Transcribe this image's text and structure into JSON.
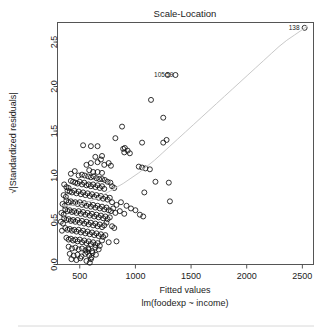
{
  "plot": {
    "title": "Scale-Location",
    "xlabel": "Fitted values",
    "sublabel": "lm(foodexp ~ income)",
    "ylabel": "√|Standardized residuals|",
    "ylabel_radical": "√",
    "ylabel_body": "|Standardized residuals|"
  },
  "axes": {
    "x_ticks": [
      "500",
      "1000",
      "1500",
      "2000",
      "2500"
    ],
    "y_ticks": [
      "0.0",
      "0.5",
      "1.0",
      "1.5",
      "2.0",
      "2.5"
    ]
  },
  "annotations": [
    {
      "name": "outlier-label-138",
      "text": "138",
      "x": 2520,
      "y": 2.66
    },
    {
      "name": "outlier-label-105",
      "text": "105",
      "x": 1310,
      "y": 2.13
    },
    {
      "name": "outlier-label-59",
      "text": "59",
      "x": 1385,
      "y": 2.13
    }
  ],
  "colors": {
    "point_stroke": "#111111",
    "loess_line": "#c9c9c9",
    "axis": "#555555",
    "text": "#222222",
    "background": "#ffffff"
  },
  "chart_data": {
    "type": "scatter",
    "title": "Scale-Location",
    "xlabel": "Fitted values",
    "ylabel": "√|Standardized residuals|",
    "sublabel": "lm(foodexp ~ income)",
    "grid": false,
    "legend": "none",
    "xlim": [
      300,
      2600
    ],
    "ylim": [
      0.0,
      2.72
    ],
    "x_ticks": [
      500,
      1000,
      1500,
      2000,
      2500
    ],
    "y_ticks": [
      0.0,
      0.5,
      1.0,
      1.5,
      2.0,
      2.5
    ],
    "point_marker": "open-circle",
    "points": [
      [
        2520,
        2.66
      ],
      [
        1290,
        2.13
      ],
      [
        1360,
        2.13
      ],
      [
        1140,
        1.85
      ],
      [
        1250,
        1.65
      ],
      [
        880,
        1.55
      ],
      [
        1280,
        1.4
      ],
      [
        1250,
        1.37
      ],
      [
        1060,
        1.37
      ],
      [
        820,
        1.42
      ],
      [
        530,
        1.34
      ],
      [
        600,
        1.33
      ],
      [
        660,
        1.33
      ],
      [
        905,
        1.31
      ],
      [
        930,
        1.28
      ],
      [
        900,
        1.26
      ],
      [
        950,
        1.25
      ],
      [
        890,
        1.3
      ],
      [
        700,
        1.22
      ],
      [
        690,
        1.18
      ],
      [
        640,
        1.21
      ],
      [
        660,
        1.15
      ],
      [
        600,
        1.14
      ],
      [
        560,
        1.12
      ],
      [
        720,
        1.12
      ],
      [
        760,
        1.14
      ],
      [
        780,
        1.11
      ],
      [
        1030,
        1.1
      ],
      [
        1060,
        1.09
      ],
      [
        1090,
        1.08
      ],
      [
        1130,
        1.07
      ],
      [
        585,
        1.06
      ],
      [
        620,
        1.04
      ],
      [
        660,
        1.04
      ],
      [
        700,
        1.03
      ],
      [
        455,
        1.05
      ],
      [
        420,
        1.02
      ],
      [
        490,
        1.0
      ],
      [
        520,
        1.01
      ],
      [
        545,
        1.0
      ],
      [
        575,
        0.99
      ],
      [
        600,
        0.98
      ],
      [
        625,
        0.99
      ],
      [
        650,
        0.97
      ],
      [
        675,
        0.96
      ],
      [
        700,
        0.96
      ],
      [
        725,
        0.95
      ],
      [
        750,
        0.93
      ],
      [
        775,
        0.92
      ],
      [
        420,
        0.94
      ],
      [
        440,
        0.93
      ],
      [
        460,
        0.92
      ],
      [
        480,
        0.91
      ],
      [
        500,
        0.93
      ],
      [
        520,
        0.9
      ],
      [
        540,
        0.92
      ],
      [
        560,
        0.89
      ],
      [
        580,
        0.9
      ],
      [
        600,
        0.88
      ],
      [
        620,
        0.9
      ],
      [
        640,
        0.87
      ],
      [
        660,
        0.89
      ],
      [
        680,
        0.86
      ],
      [
        700,
        0.88
      ],
      [
        720,
        0.85
      ],
      [
        360,
        0.9
      ],
      [
        380,
        0.87
      ],
      [
        400,
        0.86
      ],
      [
        790,
        0.88
      ],
      [
        810,
        0.86
      ],
      [
        1180,
        0.93
      ],
      [
        1300,
        0.92
      ],
      [
        1080,
        0.81
      ],
      [
        1310,
        0.71
      ],
      [
        390,
        0.83
      ],
      [
        410,
        0.82
      ],
      [
        430,
        0.81
      ],
      [
        450,
        0.83
      ],
      [
        470,
        0.8
      ],
      [
        490,
        0.82
      ],
      [
        510,
        0.79
      ],
      [
        530,
        0.81
      ],
      [
        550,
        0.78
      ],
      [
        570,
        0.8
      ],
      [
        590,
        0.77
      ],
      [
        610,
        0.79
      ],
      [
        630,
        0.76
      ],
      [
        650,
        0.78
      ],
      [
        670,
        0.75
      ],
      [
        690,
        0.77
      ],
      [
        710,
        0.74
      ],
      [
        730,
        0.76
      ],
      [
        750,
        0.73
      ],
      [
        770,
        0.75
      ],
      [
        355,
        0.78
      ],
      [
        375,
        0.76
      ],
      [
        790,
        0.7
      ],
      [
        830,
        0.67
      ],
      [
        870,
        0.7
      ],
      [
        920,
        0.66
      ],
      [
        960,
        0.63
      ],
      [
        1000,
        0.61
      ],
      [
        1040,
        0.56
      ],
      [
        1070,
        0.54
      ],
      [
        380,
        0.72
      ],
      [
        400,
        0.7
      ],
      [
        420,
        0.71
      ],
      [
        440,
        0.69
      ],
      [
        460,
        0.7
      ],
      [
        480,
        0.68
      ],
      [
        500,
        0.7
      ],
      [
        520,
        0.67
      ],
      [
        540,
        0.69
      ],
      [
        560,
        0.66
      ],
      [
        580,
        0.68
      ],
      [
        600,
        0.65
      ],
      [
        620,
        0.67
      ],
      [
        640,
        0.64
      ],
      [
        660,
        0.66
      ],
      [
        680,
        0.63
      ],
      [
        700,
        0.65
      ],
      [
        720,
        0.62
      ],
      [
        740,
        0.64
      ],
      [
        760,
        0.61
      ],
      [
        345,
        0.68
      ],
      [
        365,
        0.66
      ],
      [
        780,
        0.6
      ],
      [
        800,
        0.63
      ],
      [
        820,
        0.58
      ],
      [
        860,
        0.6
      ],
      [
        900,
        0.57
      ],
      [
        370,
        0.62
      ],
      [
        390,
        0.6
      ],
      [
        410,
        0.61
      ],
      [
        430,
        0.59
      ],
      [
        450,
        0.6
      ],
      [
        470,
        0.58
      ],
      [
        490,
        0.6
      ],
      [
        510,
        0.57
      ],
      [
        530,
        0.59
      ],
      [
        550,
        0.56
      ],
      [
        570,
        0.58
      ],
      [
        590,
        0.55
      ],
      [
        610,
        0.57
      ],
      [
        630,
        0.54
      ],
      [
        650,
        0.56
      ],
      [
        670,
        0.53
      ],
      [
        690,
        0.55
      ],
      [
        710,
        0.52
      ],
      [
        335,
        0.58
      ],
      [
        355,
        0.56
      ],
      [
        730,
        0.54
      ],
      [
        750,
        0.51
      ],
      [
        770,
        0.53
      ],
      [
        360,
        0.52
      ],
      [
        380,
        0.5
      ],
      [
        400,
        0.51
      ],
      [
        420,
        0.49
      ],
      [
        440,
        0.5
      ],
      [
        460,
        0.48
      ],
      [
        480,
        0.5
      ],
      [
        500,
        0.47
      ],
      [
        520,
        0.49
      ],
      [
        540,
        0.46
      ],
      [
        560,
        0.48
      ],
      [
        580,
        0.45
      ],
      [
        600,
        0.47
      ],
      [
        620,
        0.44
      ],
      [
        640,
        0.46
      ],
      [
        660,
        0.43
      ],
      [
        680,
        0.45
      ],
      [
        700,
        0.42
      ],
      [
        720,
        0.44
      ],
      [
        740,
        0.47
      ],
      [
        330,
        0.48
      ],
      [
        350,
        0.46
      ],
      [
        790,
        0.43
      ],
      [
        810,
        0.41
      ],
      [
        370,
        0.41
      ],
      [
        390,
        0.39
      ],
      [
        410,
        0.4
      ],
      [
        430,
        0.38
      ],
      [
        450,
        0.39
      ],
      [
        470,
        0.37
      ],
      [
        490,
        0.39
      ],
      [
        510,
        0.36
      ],
      [
        530,
        0.38
      ],
      [
        550,
        0.35
      ],
      [
        570,
        0.37
      ],
      [
        590,
        0.34
      ],
      [
        610,
        0.36
      ],
      [
        630,
        0.33
      ],
      [
        650,
        0.35
      ],
      [
        670,
        0.32
      ],
      [
        690,
        0.34
      ],
      [
        710,
        0.31
      ],
      [
        730,
        0.33
      ],
      [
        340,
        0.38
      ],
      [
        380,
        0.3
      ],
      [
        400,
        0.28
      ],
      [
        420,
        0.29
      ],
      [
        440,
        0.27
      ],
      [
        460,
        0.28
      ],
      [
        480,
        0.26
      ],
      [
        500,
        0.28
      ],
      [
        520,
        0.25
      ],
      [
        540,
        0.27
      ],
      [
        560,
        0.24
      ],
      [
        580,
        0.26
      ],
      [
        600,
        0.23
      ],
      [
        620,
        0.25
      ],
      [
        640,
        0.22
      ],
      [
        660,
        0.24
      ],
      [
        680,
        0.21
      ],
      [
        700,
        0.27
      ],
      [
        760,
        0.25
      ],
      [
        830,
        0.26
      ],
      [
        400,
        0.2
      ],
      [
        430,
        0.18
      ],
      [
        460,
        0.19
      ],
      [
        490,
        0.17
      ],
      [
        520,
        0.18
      ],
      [
        550,
        0.16
      ],
      [
        580,
        0.17
      ],
      [
        610,
        0.15
      ],
      [
        640,
        0.19
      ],
      [
        670,
        0.17
      ],
      [
        410,
        0.12
      ],
      [
        445,
        0.1
      ],
      [
        480,
        0.11
      ],
      [
        515,
        0.09
      ],
      [
        550,
        0.12
      ],
      [
        585,
        0.1
      ],
      [
        615,
        0.13
      ],
      [
        645,
        0.11
      ],
      [
        425,
        0.06
      ],
      [
        470,
        0.05
      ],
      [
        505,
        0.07
      ],
      [
        560,
        0.04
      ],
      [
        600,
        0.06
      ],
      [
        590,
        0.02
      ],
      [
        565,
        0.14
      ],
      [
        575,
        0.18
      ],
      [
        605,
        0.08
      ]
    ],
    "loess_line": [
      [
        335,
        0.66
      ],
      [
        400,
        0.66
      ],
      [
        470,
        0.67
      ],
      [
        540,
        0.69
      ],
      [
        610,
        0.72
      ],
      [
        680,
        0.76
      ],
      [
        750,
        0.81
      ],
      [
        820,
        0.86
      ],
      [
        890,
        0.91
      ],
      [
        960,
        0.97
      ],
      [
        1030,
        1.03
      ],
      [
        1100,
        1.1
      ],
      [
        1170,
        1.17
      ],
      [
        1240,
        1.25
      ],
      [
        1310,
        1.33
      ],
      [
        1380,
        1.41
      ],
      [
        1450,
        1.49
      ],
      [
        1520,
        1.57
      ],
      [
        1590,
        1.65
      ],
      [
        1660,
        1.73
      ],
      [
        1730,
        1.81
      ],
      [
        1800,
        1.89
      ],
      [
        1870,
        1.97
      ],
      [
        1940,
        2.05
      ],
      [
        2010,
        2.13
      ],
      [
        2080,
        2.21
      ],
      [
        2150,
        2.29
      ],
      [
        2220,
        2.37
      ],
      [
        2290,
        2.45
      ],
      [
        2360,
        2.52
      ],
      [
        2430,
        2.58
      ],
      [
        2500,
        2.64
      ],
      [
        2545,
        2.68
      ]
    ]
  }
}
